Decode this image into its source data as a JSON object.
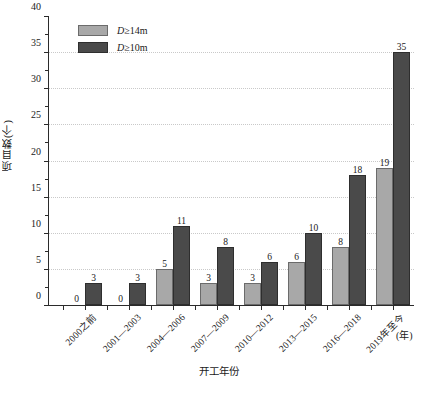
{
  "chart_data": {
    "type": "bar",
    "title": "",
    "subtitle": "",
    "xlabel": "开工年份",
    "ylabel": "项目数(个)",
    "x_unit": "(年)",
    "categories": [
      "2000之前",
      "2001—2003",
      "2004—2006",
      "2007—2009",
      "2010—2012",
      "2013—2015",
      "2016—2018",
      "2019年至今"
    ],
    "series": [
      {
        "name": "D≥14m",
        "name_prefix": "D",
        "name_suffix": "≥14m",
        "color": "#a8a8a8",
        "edge_color": "#6b6b6b",
        "values": [
          0,
          0,
          5,
          3,
          3,
          6,
          8,
          19
        ]
      },
      {
        "name": "D≥10m",
        "name_prefix": "D",
        "name_suffix": "≥10m",
        "color": "#4a4a4a",
        "edge_color": "#2e2e2e",
        "values": [
          3,
          3,
          11,
          8,
          6,
          10,
          18,
          35
        ]
      }
    ],
    "ylim": [
      0,
      40
    ],
    "ytick_labels": [
      "0",
      "5",
      "10",
      "15",
      "20",
      "25",
      "30",
      "35",
      "40"
    ],
    "ytick_values": [
      0,
      5,
      10,
      15,
      20,
      25,
      30,
      35,
      40
    ],
    "yminor_values": [
      2.5,
      7.5,
      12.5,
      17.5,
      22.5,
      27.5,
      32.5,
      37.5
    ],
    "grid": true,
    "grid_axis": "y",
    "grid_style": "dotted",
    "grid_color": "#c9c9c9",
    "legend_position": "upper left",
    "show_value_labels": true
  }
}
